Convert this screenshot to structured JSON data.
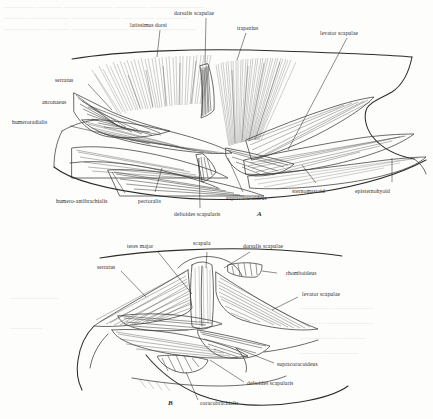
{
  "plate": {
    "caption_visible": false,
    "background_color": "#fdfdfc",
    "ink_color": "#2f2f2f",
    "figures": [
      {
        "mark": "A",
        "description": "Lateral view of superficial shoulder musculature",
        "labels": [
          "latissimus dorsi",
          "dorsalis scapulae",
          "trapezius",
          "levator scapulae",
          "serratus",
          "anconaeus",
          "humeroradialis",
          "humero-antibrachialis",
          "pectoralis",
          "deltoides scapularis",
          "supracoracoideus",
          "sternomastoid",
          "episternohyoid"
        ]
      },
      {
        "mark": "B",
        "description": "Deeper dissection showing scapula and underlying muscles",
        "labels": [
          "teres major",
          "scapula",
          "dorsalis scapulae",
          "rhomboideus",
          "serratus",
          "levator scapulae",
          "supracoracoideus",
          "deltoides scapularis",
          "coracobrachialis"
        ]
      }
    ]
  },
  "figure_a": {
    "mark": "A",
    "labels": {
      "latissimus_dorsi": "latissimus dorsi",
      "dorsalis_scapulae": "dorsalis scapulae",
      "trapezius": "trapezius",
      "levator_scapulae": "levator scapulae",
      "serratus": "serratus",
      "anconaeus": "anconaeus",
      "humeroradialis": "humeroradialis",
      "humero_antibrachialis": "humero-antibrachialis",
      "pectoralis": "pectoralis",
      "deltoides_scapularis": "deltoides scapularis",
      "supracoracoideus": "supracoracoideus",
      "sternomastoid": "sternomastoid",
      "episternohyoid": "episternohyoid"
    }
  },
  "figure_b": {
    "mark": "B",
    "labels": {
      "teres_major": "teres major",
      "scapula": "scapula",
      "dorsalis_scapulae": "dorsalis scapulae",
      "rhomboideus": "rhomboideus",
      "serratus": "serratus",
      "levator_scapulae": "levator scapulae",
      "supracoracoideus": "supracoracoideus",
      "deltoides_scapularis": "deltoides scapularis",
      "coracobrachialis": "coracobrachialis"
    }
  }
}
